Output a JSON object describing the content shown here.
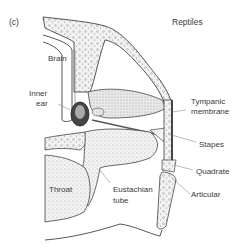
{
  "panel": {
    "label": "(c)",
    "title": "Reptiles"
  },
  "labels": {
    "brain": "Brain",
    "inner_ear_1": "Inner",
    "inner_ear_2": "ear",
    "tympanic_1": "Tympanic",
    "tympanic_2": "membrane",
    "stapes": "Stapes",
    "quadrate": "Quadrate",
    "articular": "Articular",
    "throat": "Throat",
    "eustachian_1": "Eustachian",
    "eustachian_2": "tube"
  },
  "colors": {
    "ink": "#3a3a3a",
    "stipple": "#c8c8c8",
    "bone": "#e6e6e6"
  }
}
